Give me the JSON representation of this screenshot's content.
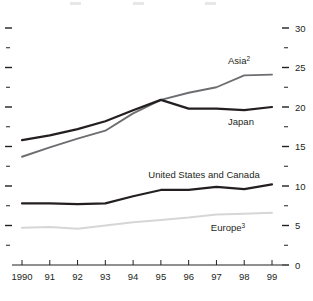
{
  "chart_data": {
    "type": "line",
    "title": "",
    "subtitle": "",
    "xlabel": "",
    "ylabel": "",
    "x": [
      "1990",
      "91",
      "92",
      "93",
      "94",
      "95",
      "96",
      "97",
      "98",
      "99"
    ],
    "categories": [
      "1990",
      "91",
      "92",
      "93",
      "94",
      "95",
      "96",
      "97",
      "98",
      "99"
    ],
    "xticklabels": [
      "1990",
      "91",
      "92",
      "93",
      "94",
      "95",
      "96",
      "97",
      "98",
      "99"
    ],
    "yticklabels": [
      "0",
      "5",
      "10",
      "15",
      "20",
      "25",
      "30"
    ],
    "ytickvalues": [
      0,
      5,
      10,
      15,
      20,
      25,
      30
    ],
    "yminorvalues": [
      2.5,
      7.5,
      12.5,
      17.5,
      22.5,
      27.5
    ],
    "ylim": [
      0,
      30
    ],
    "xlim": [
      "1990",
      "99"
    ],
    "grid": false,
    "legend_position": "inline-annotations",
    "axis_side": "right",
    "series": [
      {
        "name": "Asia",
        "label": "Asia",
        "footnote": "2",
        "color": "#6d6e71",
        "width": 1.9,
        "values": [
          13.7,
          14.9,
          16.0,
          17.0,
          19.2,
          20.9,
          21.8,
          22.5,
          24.0,
          24.1
        ]
      },
      {
        "name": "Japan",
        "label": "Japan",
        "footnote": "",
        "color": "#231f20",
        "width": 2.2,
        "values": [
          15.8,
          16.4,
          17.2,
          18.2,
          19.6,
          20.9,
          19.8,
          19.8,
          19.6,
          20.0
        ]
      },
      {
        "name": "United States and Canada",
        "label": "United States and Canada",
        "footnote": "",
        "color": "#231f20",
        "width": 2.2,
        "values": [
          7.8,
          7.8,
          7.7,
          7.8,
          8.7,
          9.5,
          9.5,
          9.9,
          9.6,
          10.2
        ]
      },
      {
        "name": "Europe",
        "label": "Europe",
        "footnote": "3",
        "color": "#d6d6d6",
        "width": 2.0,
        "values": [
          4.7,
          4.8,
          4.6,
          5.0,
          5.4,
          5.7,
          6.0,
          6.4,
          6.5,
          6.6
        ]
      }
    ],
    "annotations": [
      {
        "text": "Asia",
        "sup": "2",
        "x": 239,
        "y": 64,
        "anchor": "middle"
      },
      {
        "text": "Japan",
        "sup": "",
        "x": 241,
        "y": 125,
        "anchor": "middle"
      },
      {
        "text": "United States and Canada",
        "sup": "",
        "x": 204,
        "y": 178,
        "anchor": "middle"
      },
      {
        "text": "Europe",
        "sup": "3",
        "x": 228,
        "y": 231,
        "anchor": "middle"
      }
    ]
  }
}
